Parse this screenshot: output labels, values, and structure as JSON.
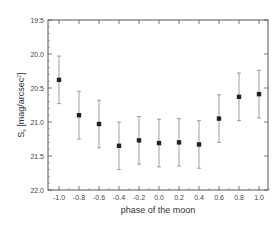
{
  "chart_data": {
    "type": "scatter",
    "title": "",
    "xlabel": "phase of the moon",
    "ylabel": "S_s [mag/arcsec^2]",
    "ylabel_main": "S",
    "ylabel_sub": "s",
    "ylabel_unit": " [mag/arcsec",
    "ylabel_sup": "2",
    "ylabel_close": "]",
    "xlim": [
      -1.1,
      1.1
    ],
    "ylim": [
      22.0,
      19.5
    ],
    "y_inverted": true,
    "grid": false,
    "legend": null,
    "x_ticks": [
      "-1.0",
      "-0.8",
      "-0.6",
      "-0.4",
      "-0.2",
      "0.0",
      "0.2",
      "0.4",
      "0.6",
      "0.8",
      "1.0"
    ],
    "y_ticks": [
      "19.5",
      "20.0",
      "20.5",
      "21.0",
      "21.5",
      "22.0"
    ],
    "series": [
      {
        "name": "sky brightness",
        "marker": "square",
        "x": [
          -1.0,
          -0.8,
          -0.6,
          -0.4,
          -0.2,
          0.0,
          0.2,
          0.4,
          0.6,
          0.8,
          1.0
        ],
        "y": [
          20.38,
          20.9,
          21.03,
          21.35,
          21.27,
          21.31,
          21.3,
          21.33,
          20.95,
          20.63,
          20.59
        ],
        "yerr": [
          0.35,
          0.35,
          0.35,
          0.35,
          0.35,
          0.35,
          0.35,
          0.35,
          0.35,
          0.35,
          0.35
        ]
      }
    ]
  }
}
